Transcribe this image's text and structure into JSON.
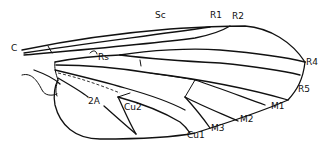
{
  "diagram": {
    "labels": {
      "c": "C",
      "sc": "Sc",
      "r1": "R1",
      "r2": "R2",
      "rs": "Rs",
      "r4": "R4",
      "r5": "R5",
      "m1": "M1",
      "m2": "M2",
      "m3": "M3",
      "cu1": "Cu1",
      "cu2": "Cu2",
      "a2": "2A"
    },
    "colors": {
      "line": "#111111",
      "background": "#ffffff"
    }
  }
}
